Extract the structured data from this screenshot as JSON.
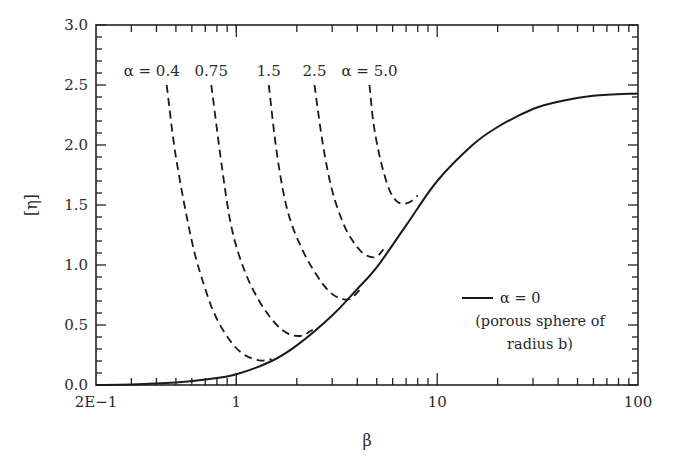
{
  "chart_data": {
    "type": "line",
    "title": "",
    "xlabel": "β",
    "ylabel": "[η]",
    "xscale": "log",
    "xlim": [
      0.2,
      100
    ],
    "ylim": [
      0.0,
      3.0
    ],
    "grid": false,
    "x_ticks": [
      {
        "value": 0.2,
        "label": "2E−1"
      },
      {
        "value": 1,
        "label": "1"
      },
      {
        "value": 10,
        "label": "10"
      },
      {
        "value": 100,
        "label": "100"
      }
    ],
    "y_ticks": [
      {
        "value": 0.0,
        "label": "0.0"
      },
      {
        "value": 0.5,
        "label": "0.5"
      },
      {
        "value": 1.0,
        "label": "1.0"
      },
      {
        "value": 1.5,
        "label": "1.5"
      },
      {
        "value": 2.0,
        "label": "2.0"
      },
      {
        "value": 2.5,
        "label": "2.5"
      },
      {
        "value": 3.0,
        "label": "3.0"
      }
    ],
    "legend": {
      "position": "lower-right",
      "line1": "α = 0",
      "line2": "(porous sphere of",
      "line3": "radius b)"
    },
    "series": [
      {
        "name": "α = 0",
        "style": "solid",
        "x": [
          0.2,
          0.3,
          0.5,
          0.7,
          1.0,
          1.5,
          2.0,
          3.0,
          4.0,
          5.0,
          7.0,
          10,
          15,
          20,
          30,
          40,
          60,
          100
        ],
        "y": [
          0.0,
          0.003,
          0.02,
          0.045,
          0.09,
          0.2,
          0.33,
          0.58,
          0.8,
          0.98,
          1.33,
          1.7,
          2.0,
          2.15,
          2.3,
          2.36,
          2.41,
          2.43
        ]
      },
      {
        "name": "α = 0.4",
        "label": "α = 0.4",
        "style": "dashed",
        "x": [
          0.45,
          0.5,
          0.6,
          0.7,
          0.8,
          0.95,
          1.1,
          1.3,
          1.5
        ],
        "y": [
          2.5,
          1.9,
          1.2,
          0.8,
          0.55,
          0.35,
          0.25,
          0.205,
          0.215
        ]
      },
      {
        "name": "α = 0.75",
        "label": "0.75",
        "style": "dashed",
        "x": [
          0.75,
          0.85,
          0.95,
          1.1,
          1.3,
          1.55,
          1.8,
          2.1,
          2.4
        ],
        "y": [
          2.5,
          1.8,
          1.3,
          0.95,
          0.7,
          0.52,
          0.43,
          0.41,
          0.46
        ]
      },
      {
        "name": "α = 1.5",
        "label": "1.5",
        "style": "dashed",
        "x": [
          1.45,
          1.6,
          1.8,
          2.1,
          2.5,
          2.9,
          3.3,
          3.7,
          4.1
        ],
        "y": [
          2.5,
          1.9,
          1.45,
          1.15,
          0.92,
          0.78,
          0.72,
          0.72,
          0.79
        ]
      },
      {
        "name": "α = 2.5",
        "label": "2.5",
        "style": "dashed",
        "x": [
          2.45,
          2.7,
          3.0,
          3.4,
          3.8,
          4.2,
          4.6,
          5.0,
          5.4
        ],
        "y": [
          2.5,
          2.0,
          1.62,
          1.35,
          1.2,
          1.11,
          1.07,
          1.07,
          1.13
        ]
      },
      {
        "name": "α = 5.0",
        "label": "α = 5.0",
        "style": "dashed",
        "x": [
          4.6,
          4.8,
          5.1,
          5.4,
          5.8,
          6.3,
          6.8,
          7.4,
          8.0
        ],
        "y": [
          2.5,
          2.2,
          1.95,
          1.78,
          1.62,
          1.53,
          1.51,
          1.53,
          1.58
        ]
      }
    ]
  }
}
